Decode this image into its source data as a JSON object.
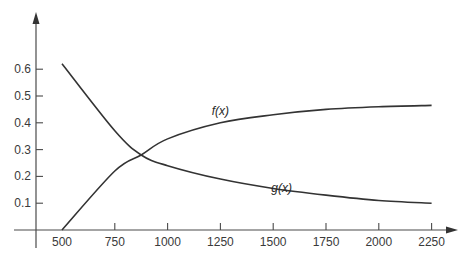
{
  "chart_data": {
    "type": "line",
    "title": "",
    "xlabel": "",
    "ylabel": "",
    "xlim": [
      380,
      2330
    ],
    "ylim": [
      0,
      0.7
    ],
    "grid": false,
    "legend": "none (inline curve labels)",
    "x_ticks": [
      500,
      750,
      1000,
      1250,
      1500,
      1750,
      2000,
      2250
    ],
    "x_tick_labels": [
      "500",
      "750",
      "1000",
      "1250",
      "1500",
      "1750",
      "2000",
      "2250"
    ],
    "y_ticks": [
      0.1,
      0.2,
      0.3,
      0.4,
      0.5,
      0.6
    ],
    "y_tick_labels": [
      "0.1",
      "0.2",
      "0.3",
      "0.4",
      "0.5",
      "0.6"
    ],
    "x": [
      500,
      750,
      875,
      1000,
      1250,
      1500,
      1750,
      2000,
      2250
    ],
    "series": [
      {
        "name": "f(x)",
        "values": [
          0.0,
          0.22,
          0.28,
          0.34,
          0.4,
          0.43,
          0.45,
          0.46,
          0.465
        ]
      },
      {
        "name": "g(x)",
        "values": [
          0.62,
          0.37,
          0.28,
          0.24,
          0.19,
          0.155,
          0.13,
          0.11,
          0.1
        ]
      }
    ],
    "annotations": [
      {
        "text": "f(x)",
        "x": 1250,
        "y": 0.43
      },
      {
        "text": "g(x)",
        "x": 1540,
        "y": 0.14
      }
    ],
    "intersection": {
      "x": 875,
      "y": 0.28
    }
  },
  "labels": {
    "f_label": "f(x)",
    "g_label": "g(x)"
  }
}
